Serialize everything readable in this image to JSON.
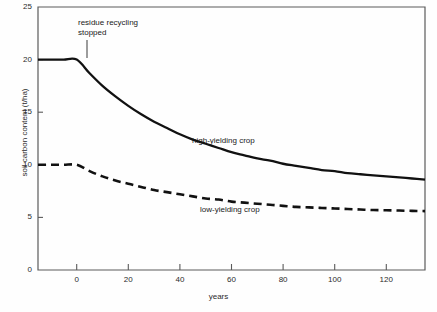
{
  "figure": {
    "name": "soil-carbon-decline-chart"
  },
  "chart_data": {
    "type": "line",
    "title": "",
    "xlabel": "years",
    "ylabel": "soil carbon content (t/ha)",
    "xlim": [
      -15,
      135
    ],
    "ylim": [
      0,
      25
    ],
    "xticks": [
      0,
      20,
      40,
      60,
      80,
      100,
      120
    ],
    "xtick_labels": [
      "0",
      "20",
      "40",
      "60",
      "80",
      "100",
      "120"
    ],
    "yticks": [
      0,
      5,
      10,
      15,
      20,
      25
    ],
    "ytick_labels": [
      "0",
      "5",
      "10",
      "15",
      "20",
      "25"
    ],
    "grid": false,
    "legend_position": "inline-annotation",
    "annotations": [
      {
        "name": "residue-recycling-stopped",
        "text_lines": [
          "residue recycling",
          "stopped"
        ],
        "points_to_x": 0,
        "leader_line": true
      }
    ],
    "series": [
      {
        "name": "high-yielding crop",
        "style": "solid",
        "color": "#111111",
        "label_text": "high-yielding crop",
        "plateau_value": 20,
        "asymptote": 8.2,
        "decay_start_x": 0,
        "x": [
          -15,
          -10,
          -5,
          0,
          5,
          10,
          15,
          20,
          25,
          30,
          35,
          40,
          45,
          50,
          55,
          60,
          65,
          70,
          75,
          80,
          85,
          90,
          95,
          100,
          105,
          110,
          115,
          120,
          125,
          130,
          135
        ],
        "y": [
          20.0,
          20.0,
          20.0,
          20.0,
          18.7,
          17.5,
          16.5,
          15.6,
          14.8,
          14.1,
          13.5,
          12.9,
          12.4,
          12.0,
          11.6,
          11.2,
          10.9,
          10.6,
          10.4,
          10.1,
          9.9,
          9.7,
          9.5,
          9.4,
          9.2,
          9.1,
          9.0,
          8.9,
          8.8,
          8.7,
          8.6
        ]
      },
      {
        "name": "low-yielding crop",
        "style": "dashed",
        "color": "#111111",
        "label_text": "low-yielding crop",
        "plateau_value": 10,
        "asymptote": 5.5,
        "decay_start_x": 0,
        "x": [
          -15,
          -10,
          -5,
          0,
          5,
          10,
          15,
          20,
          25,
          30,
          35,
          40,
          45,
          50,
          55,
          60,
          65,
          70,
          75,
          80,
          85,
          90,
          95,
          100,
          105,
          110,
          115,
          120,
          125,
          130,
          135
        ],
        "y": [
          10.0,
          10.0,
          10.0,
          10.0,
          9.4,
          8.9,
          8.5,
          8.2,
          7.9,
          7.6,
          7.4,
          7.2,
          7.0,
          6.8,
          6.7,
          6.5,
          6.4,
          6.3,
          6.2,
          6.1,
          6.0,
          5.95,
          5.9,
          5.85,
          5.8,
          5.75,
          5.7,
          5.68,
          5.65,
          5.62,
          5.6
        ]
      }
    ]
  },
  "style": {
    "axis_color": "#5a5a5a",
    "curve_color": "#111111",
    "text_color": "#1a1a1a",
    "background": "#ffffff"
  }
}
